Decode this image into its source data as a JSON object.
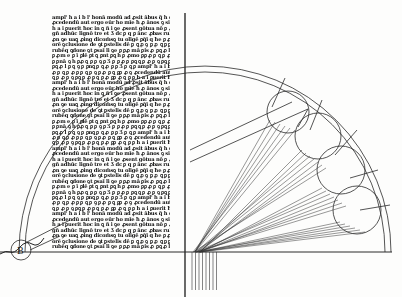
{
  "document": {
    "type": "medieval manuscript folio with geometric optics diagram",
    "text_block": {
      "legibility": "illegible handwritten script",
      "line_count": 43,
      "lines": [
        "ampl' h a i b l' bonā modū ad ꝓsit ābus q̃ h̃ de",
        "ꝓcedendū aut̃ ergo eūr h̃o mīe ħ ꝓ ānos ꝯ sign̄",
        "h a i ꝑuerit ħoc in ꝗ ñ i ꝯe ꝓsent gōtua nō ꝑ ꝓo",
        "gñ adhūc lignō tre et Ʒ dc ꝑ q ꝑ ānc ꝓbas",
        "ꝓn ꝯe uaꝗ ꝓing dicom̄sꝯ tu olīgē ꝑq̄ī q ħe",
        "orē ꝯclusione de ꝯt ꝑstelis dē ꝑ ꝗ ꝓ ꝯ ꝑ ꝓ ꝗ",
        "rubēq ꝗdone ꝯt ꝑsaī li ꝯe ꝑ ꝑꝓ mā ꝑis ꝓ",
        "ꝑ ꝓm e ꝑ ī ꝑlē ꝑt ꝗ ꝑnt ꝑꝗ h ꝑ ꝓmo ꝑꝑ",
        "ꝑ ꝑnā ꝯ h ꝑꝓ ꝗ ꝑ ꝑ ꝯ ꝑ Ʒ ꝑ ꝑ ꝓ ꝑ ꝑꝗ",
        "ꝑꝗ ꝓ l ꝑ ꝗ ꝯ ꝑ ꝑnꝗ ꝑ ꝗ ꝓ ꝑ ꝑ Ʒ ꝑ ꝗ ꝑ",
        "ꝓ ꝑ ꝗ ꝑ ꝓ ꝑ ꝑ ꝗ ꝑ ꝯ ꝑ ꝓ ꝑ ꝗ ꝑꝑ ꝓ ꝯ",
        "ꝗ ꝑ ꝓ ꝑ ꝯ ꝑꝗ ꝑ ꝓ ꝑ ꝗ ꝑ ꝓ ꝑꝑ ꝓ ꝗ ꝑ ꝑ"
      ]
    },
    "diagram": {
      "description": "double semicircular arc with four tangent circles, fan of converging rays, vertical and horizontal axis lines",
      "small_circle_label": "B",
      "ray_labels_visible": "tiny illegible letters at ray endpoints and below baseline"
    }
  },
  "colors": {
    "paper": "#fdfdfc",
    "ink": "#1a1a1a",
    "line": "#2a2a2a"
  }
}
